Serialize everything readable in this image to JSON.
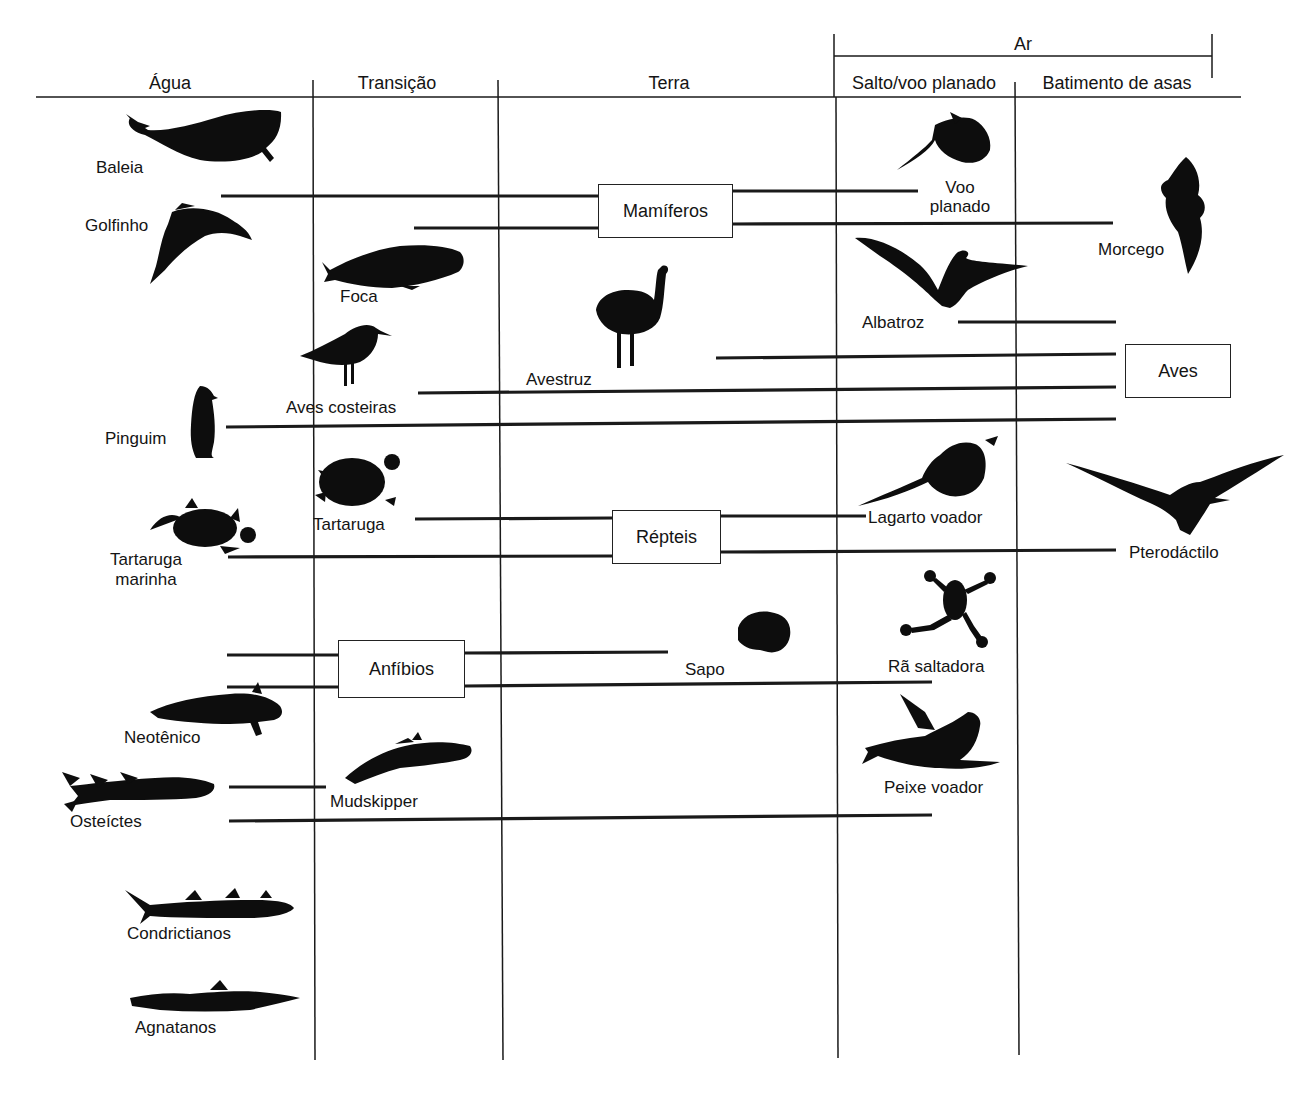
{
  "header": {
    "air_label": "Ar",
    "columns": [
      {
        "id": "agua",
        "label": "Água",
        "x": 170
      },
      {
        "id": "transicao",
        "label": "Transição",
        "x": 397
      },
      {
        "id": "terra",
        "label": "Terra",
        "x": 669
      },
      {
        "id": "salto",
        "label": "Salto/voo planado",
        "x": 924
      },
      {
        "id": "batimento",
        "label": "Batimento de asas",
        "x": 1117
      }
    ]
  },
  "groups": {
    "mamiferos": "Mamíferos",
    "aves": "Aves",
    "repteis": "Répteis",
    "anfibios": "Anfíbios"
  },
  "animals": {
    "baleia": "Baleia",
    "golfinho": "Golfinho",
    "foca": "Foca",
    "voo_planado_1": "Voo",
    "voo_planado_2": "planado",
    "morcego": "Morcego",
    "albatroz": "Albatroz",
    "avestruz": "Avestruz",
    "aves_costeiras": "Aves costeiras",
    "pinguim": "Pinguim",
    "tartaruga": "Tartaruga",
    "tartaruga_marinha_1": "Tartaruga",
    "tartaruga_marinha_2": "marinha",
    "lagarto_voador": "Lagarto voador",
    "pterodactilo": "Pterodáctilo",
    "sapo": "Sapo",
    "ra_saltadora": "Rã saltadora",
    "neotenico": "Neotênico",
    "mudskipper": "Mudskipper",
    "osteictes": "Osteíctes",
    "peixe_voador": "Peixe voador",
    "condrictianos": "Condrictianos",
    "agnatanos": "Agnatanos"
  },
  "colors": {
    "ink": "#141414",
    "background": "#ffffff"
  }
}
